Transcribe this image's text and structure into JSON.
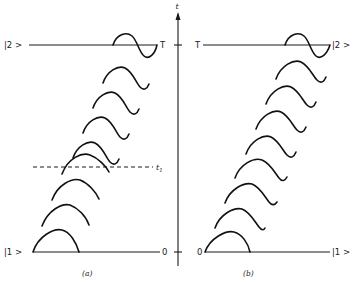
{
  "figure": {
    "panel_a": {
      "caption": "(a)",
      "top_left_label": "|2 >",
      "top_right_label": "T",
      "bottom_left_label": "|1 >",
      "bottom_right_label": "0",
      "dashed_line_label": "t",
      "dashed_line_subscript": "1"
    },
    "panel_b": {
      "caption": "(b)",
      "axis_label": "t",
      "top_left_label": "T",
      "top_right_label": "|2 >",
      "bottom_left_label": "0",
      "bottom_right_label": "|1 >"
    }
  }
}
